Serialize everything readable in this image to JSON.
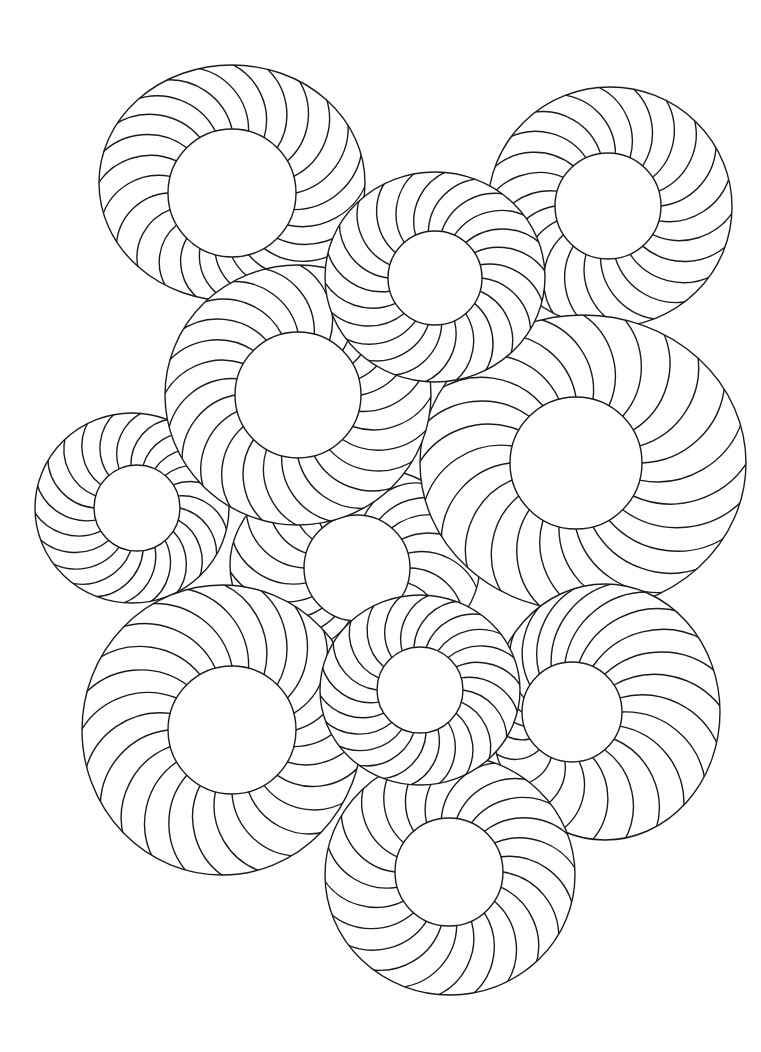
{
  "page": {
    "background_color": "#ffffff",
    "line_color": "#1a1a1a"
  },
  "medallions": [
    {
      "name": "medallion-center",
      "spokes": 22,
      "twist": 1
    },
    {
      "name": "medallion-top-left",
      "spokes": 24,
      "twist": -1
    },
    {
      "name": "medallion-top-right",
      "spokes": 22,
      "twist": -1
    },
    {
      "name": "medallion-middle-right",
      "spokes": 24,
      "twist": -1
    },
    {
      "name": "medallion-left-small",
      "spokes": 22,
      "twist": 1
    },
    {
      "name": "medallion-mid-left",
      "spokes": 24,
      "twist": -1
    },
    {
      "name": "medallion-top-center",
      "spokes": 22,
      "twist": 1
    },
    {
      "name": "medallion-bottom-left",
      "spokes": 24,
      "twist": -1
    },
    {
      "name": "medallion-bottom-right",
      "spokes": 22,
      "twist": 1
    },
    {
      "name": "medallion-bottom-center",
      "spokes": 22,
      "twist": 1
    },
    {
      "name": "medallion-lower-center",
      "spokes": 22,
      "twist": 1
    }
  ]
}
